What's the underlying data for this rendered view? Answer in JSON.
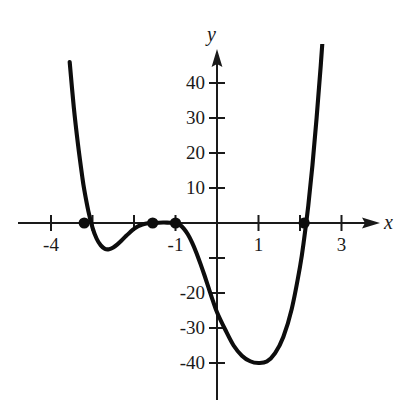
{
  "figure": {
    "background_color": "#ffffff",
    "curve_color": "#0d0d0d",
    "axis_color": "#1a1a1a",
    "x_axis_name": "x",
    "y_axis_name": "y"
  },
  "chart_data": {
    "type": "line",
    "title": "",
    "xlabel": "x",
    "ylabel": "y",
    "xlim": [
      -4.2,
      3.6
    ],
    "ylim": [
      -46,
      48
    ],
    "grid": false,
    "legend": null,
    "x_ticks": [
      -4,
      -3,
      -2,
      -1,
      1,
      2,
      3
    ],
    "x_tick_labels": [
      "-4",
      "",
      "",
      "-1",
      "1",
      "",
      "3"
    ],
    "y_ticks": [
      40,
      30,
      20,
      10,
      -10,
      -20,
      -30,
      -40
    ],
    "y_tick_labels": [
      "40",
      "30",
      "20",
      "10",
      "",
      "-20",
      "-30",
      "-40"
    ],
    "series": [
      {
        "name": "quartic",
        "x": [
          -3.55,
          -3.45,
          -3.35,
          -3.25,
          -3.2,
          -3.1,
          -3.0,
          -2.9,
          -2.8,
          -2.7,
          -2.6,
          -2.5,
          -2.4,
          -2.3,
          -2.2,
          -2.1,
          -2.0,
          -1.9,
          -1.8,
          -1.7,
          -1.6,
          -1.55,
          -1.5,
          -1.4,
          -1.3,
          -1.2,
          -1.1,
          -1.0,
          -0.9,
          -0.8,
          -0.7,
          -0.6,
          -0.5,
          -0.4,
          -0.3,
          -0.2,
          -0.1,
          0.0,
          0.2,
          0.4,
          0.6,
          0.8,
          1.0,
          1.2,
          1.4,
          1.6,
          1.8,
          2.0,
          2.1,
          2.2,
          2.3,
          2.4,
          2.5,
          2.6
        ],
        "y": [
          46.0,
          33.0,
          22.5,
          13.5,
          9.6,
          3.4,
          -1.3,
          -4.5,
          -6.4,
          -7.4,
          -7.5,
          -7.0,
          -6.1,
          -5.0,
          -3.8,
          -2.7,
          -1.7,
          -0.95,
          -0.42,
          -0.12,
          -0.01,
          0.0,
          0.02,
          0.09,
          0.13,
          0.12,
          0.06,
          0.0,
          -0.5,
          -1.6,
          -3.3,
          -5.6,
          -8.4,
          -11.6,
          -15.0,
          -18.6,
          -22.2,
          -25.5,
          -30.5,
          -35.0,
          -37.9,
          -39.5,
          -40.0,
          -39.6,
          -37.2,
          -32.5,
          -24.6,
          -12.5,
          -4.5,
          5.0,
          16.5,
          30.0,
          45.0,
          62.0
        ]
      }
    ],
    "marked_points": [
      {
        "label": "root-1",
        "x": -3.2,
        "y": 0
      },
      {
        "label": "root-2",
        "x": -1.55,
        "y": 0
      },
      {
        "label": "root-3",
        "x": -1.0,
        "y": 0
      },
      {
        "label": "root-4",
        "x": 2.1,
        "y": 0
      }
    ],
    "annotations": []
  },
  "axis_labels": {
    "x_name": "x",
    "y_name": "y",
    "x": [
      {
        "value": "-4",
        "at": -4
      },
      {
        "value": "-1",
        "at": -1
      },
      {
        "value": "1",
        "at": 1
      },
      {
        "value": "3",
        "at": 3
      }
    ],
    "y": [
      {
        "value": "40",
        "at": 40
      },
      {
        "value": "30",
        "at": 30
      },
      {
        "value": "20",
        "at": 20
      },
      {
        "value": "10",
        "at": 10
      },
      {
        "value": "-20",
        "at": -20
      },
      {
        "value": "-30",
        "at": -30
      },
      {
        "value": "-40",
        "at": -40
      }
    ]
  }
}
